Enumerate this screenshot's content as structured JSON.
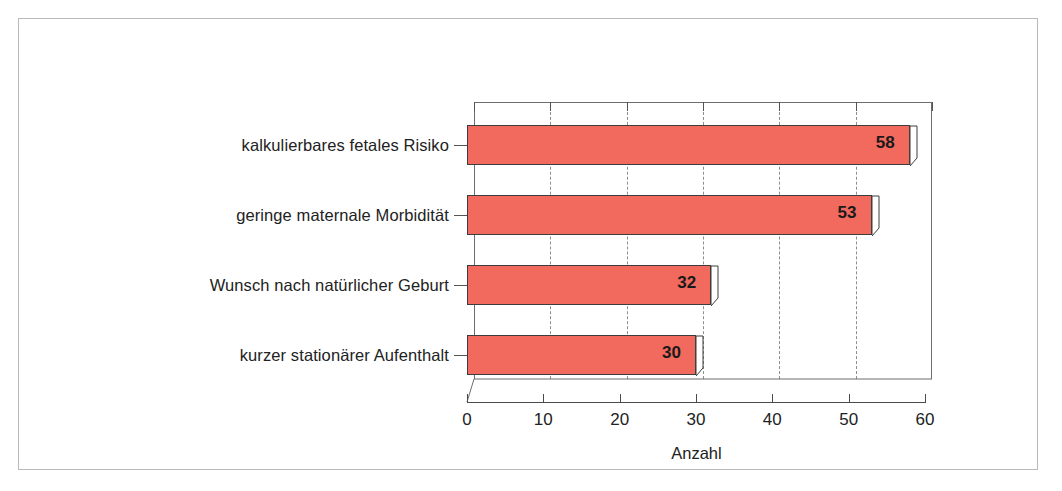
{
  "figure": {
    "background_color": "#ffffff",
    "frame_color": "#b9b9b9"
  },
  "chart_data": {
    "type": "bar",
    "orientation": "horizontal",
    "title": "",
    "subtitle": "",
    "xlabel": "Anzahl",
    "ylabel": "",
    "categories": [
      "kalkulierbares fetales Risiko",
      "geringe maternale Morbidität",
      "Wunsch nach natürlicher Geburt",
      "kurzer stationärer Aufenthalt"
    ],
    "values": [
      58,
      53,
      32,
      30
    ],
    "data_labels": [
      "58",
      "53",
      "32",
      "30"
    ],
    "xlim": [
      0,
      60
    ],
    "xticks": [
      0,
      10,
      20,
      30,
      40,
      50,
      60
    ],
    "xtick_labels": [
      "0",
      "10",
      "20",
      "30",
      "40",
      "50",
      "60"
    ],
    "grid": true,
    "grid_axis": "x",
    "grid_style": "dashed",
    "legend": false,
    "legend_position": "none",
    "bar_color": "#f2695e",
    "bar_edge_color": "#3d3d3d",
    "style": "3d-perspective"
  }
}
